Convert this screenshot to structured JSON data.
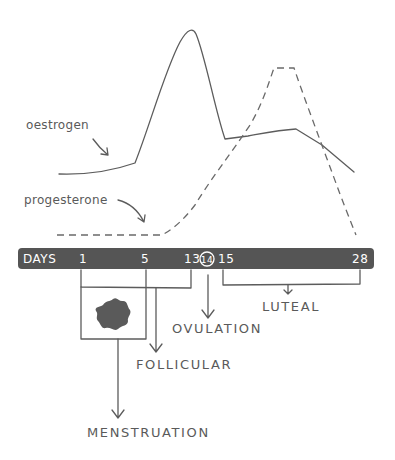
{
  "diagram": {
    "hormones": [
      {
        "name": "oestrogen",
        "line_style": "solid"
      },
      {
        "name": "progesterone",
        "line_style": "dashed"
      }
    ],
    "timeline": {
      "label": "DAYS",
      "ticks": [
        "1",
        "5",
        "13",
        "14",
        "15",
        "28"
      ],
      "highlighted_tick": "14",
      "bar_color": "#555555"
    },
    "phases": [
      {
        "name": "MENSTRUATION",
        "days": "1-5"
      },
      {
        "name": "FOLLICULAR",
        "days": "1-13"
      },
      {
        "name": "OVULATION",
        "days": "14"
      },
      {
        "name": "LUTEAL",
        "days": "15-28"
      }
    ],
    "colors": {
      "ink": "#5a5a5a",
      "bar": "#555555",
      "blob": "#5a5a5a"
    }
  }
}
